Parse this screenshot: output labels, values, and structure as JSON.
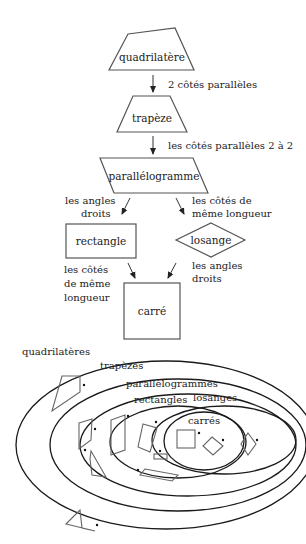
{
  "flowchart": {
    "nodes": {
      "quadrilatere": "quadrilatère",
      "trapeze": "trapèze",
      "parallelogramme": "parallélogramme",
      "rectangle": "rectangle",
      "losange": "losange",
      "carre": "carré"
    },
    "edges": {
      "quad_to_trap": "2 côtés parallèles",
      "trap_to_para": "les côtés parallèles 2 à 2",
      "para_to_rect": [
        "les angles",
        "droits"
      ],
      "para_to_los": [
        "les côtés de",
        "même longueur"
      ],
      "rect_to_carre": [
        "les côtés",
        "de même",
        "longueur"
      ],
      "los_to_carre": [
        "les angles",
        "droits"
      ]
    }
  },
  "venn": {
    "sets": {
      "quadrilateres": "quadrilatères",
      "trapezes": "trapèzes",
      "parallelogrammes": "parallèlogrammes",
      "rectangles": "rectangles",
      "losanges": "losanges",
      "carres": "carrés"
    }
  },
  "colors": {
    "outline": "#1a1a1a",
    "shape": "#666666",
    "background": "#ffffff"
  }
}
